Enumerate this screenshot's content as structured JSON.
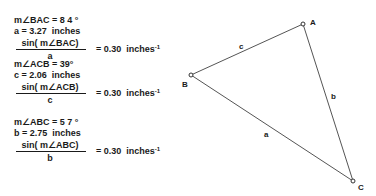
{
  "measurements": [
    {
      "angle_label": "m∠BAC = 8 4 °",
      "side_label": "a = 3.27  inches",
      "ratio_numerator": "sin( m∠BAC)",
      "ratio_denominator": "a",
      "ratio_value": "= 0.30  inches",
      "ratio_exponent": "-1"
    },
    {
      "angle_label": "m∠ACB = 39°",
      "side_label": "c = 2.06  inches",
      "ratio_numerator": "sin( m∠ACB)",
      "ratio_denominator": "c",
      "ratio_value": "= 0.30  inches",
      "ratio_exponent": "-1"
    },
    {
      "angle_label": "m∠ABC = 5 7 °",
      "side_label": "b = 2.75  inches",
      "ratio_numerator": "sin( m∠ABC)",
      "ratio_denominator": "b",
      "ratio_value": "= 0.30  inches",
      "ratio_exponent": "-1"
    }
  ],
  "triangle": {
    "vertices": {
      "A": {
        "label": "A"
      },
      "B": {
        "label": "B"
      },
      "C": {
        "label": "C"
      }
    },
    "sides": {
      "a": {
        "label": "a"
      },
      "b": {
        "label": "b"
      },
      "c": {
        "label": "c"
      }
    }
  },
  "colors": {
    "ink": "#1a1a1a",
    "line": "#555555",
    "background": "#ffffff"
  }
}
